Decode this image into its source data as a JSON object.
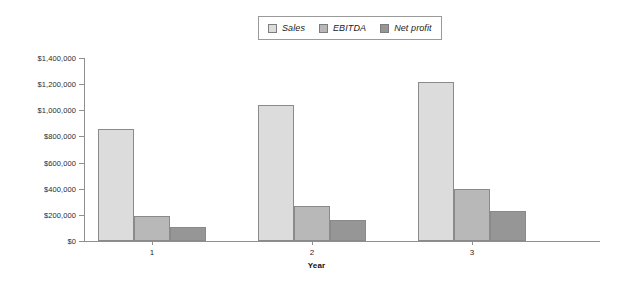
{
  "chart_data": {
    "type": "bar",
    "title": "",
    "xlabel": "Year",
    "ylabel": "",
    "categories": [
      "1",
      "2",
      "3"
    ],
    "series": [
      {
        "name": "Sales",
        "values": [
          860000,
          1040000,
          1215000
        ],
        "color": "#dcdcdc"
      },
      {
        "name": "EBITDA",
        "values": [
          195000,
          270000,
          400000
        ],
        "color": "#b8b8b8"
      },
      {
        "name": "Net profit",
        "values": [
          110000,
          160000,
          230000
        ],
        "color": "#969696"
      }
    ],
    "ylim": [
      0,
      1400000
    ],
    "ytick_values": [
      0,
      200000,
      400000,
      600000,
      800000,
      1000000,
      1200000,
      1400000
    ],
    "ytick_labels": [
      "$0",
      "$200,000",
      "$400,000",
      "$600,000",
      "$800,000",
      "$1,000,000",
      "$1,200,000",
      "$1,400,000"
    ],
    "grid": false,
    "legend_position": "top-center"
  },
  "legend": {
    "entries": [
      {
        "label": "Sales"
      },
      {
        "label": "EBITDA"
      },
      {
        "label": "Net profit"
      }
    ]
  },
  "axes": {
    "x_title": "Year"
  },
  "colors": {
    "axis": "#8f8f8f",
    "bar_border": "#8a8a8a",
    "text": "#2a2a2a",
    "legend_border": "#9a9a9a"
  }
}
